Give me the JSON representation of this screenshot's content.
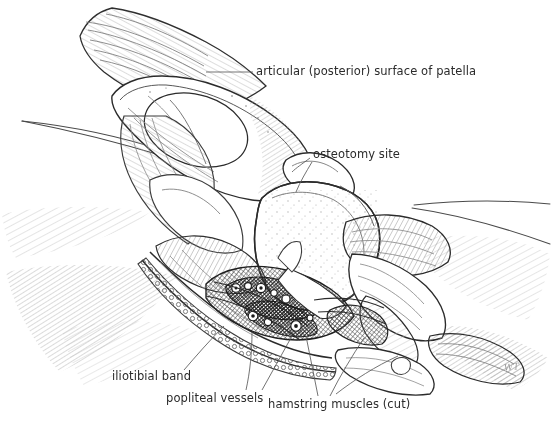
{
  "figure": {
    "kind": "anatomical-line-illustration",
    "background_color": "#ffffff",
    "ink_color": "#2b2b2b",
    "light_hatch_color": "#8e8e8e",
    "signature": "WT"
  },
  "labels": {
    "patella": "articular (posterior) surface of patella",
    "osteotomy": "osteotomy site",
    "iliotibial": "iliotibial band",
    "popliteal": "popliteal vessels",
    "hamstring": "hamstring muscles (cut)"
  }
}
